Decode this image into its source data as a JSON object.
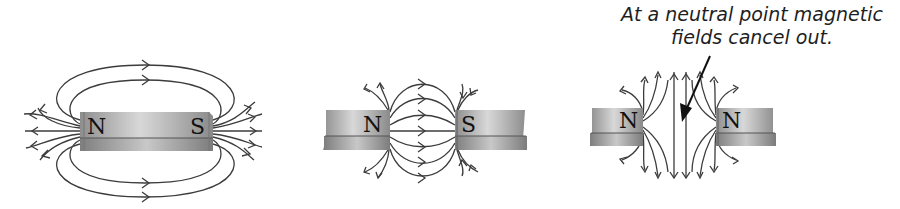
{
  "diagram": {
    "caption": {
      "line1": "At a neutral point magnetic",
      "line2": "fields cancel out."
    },
    "panels": [
      {
        "id": "single-bar-magnet",
        "poles": [
          "N",
          "S"
        ]
      },
      {
        "id": "opposite-poles-attract",
        "poles": [
          "N",
          "S"
        ]
      },
      {
        "id": "like-poles-repel",
        "poles": [
          "N",
          "N"
        ],
        "annotation": "neutral point"
      }
    ],
    "colors": {
      "magnet_top": "#a8a8a8",
      "magnet_highlight": "#d6d6d6",
      "magnet_side": "#9a9a9a",
      "field_line": "#3c3c3c",
      "text": "#1e1e1e"
    }
  }
}
